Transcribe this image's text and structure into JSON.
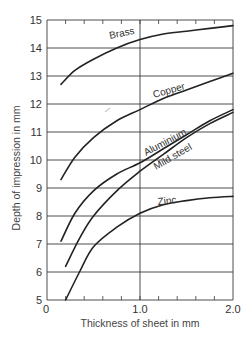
{
  "chart_data": {
    "type": "line",
    "title": "",
    "xlabel": "Thickness of sheet in mm",
    "ylabel": "Depth of impression in mm",
    "xlim": [
      0,
      2.0
    ],
    "ylim": [
      5,
      15
    ],
    "x_tick_labels": [
      "0",
      "1.0",
      "2.0"
    ],
    "x_minor_ticks_step": 0.2,
    "y_tick_labels": [
      "5",
      "6",
      "7",
      "8",
      "9",
      "10",
      "11",
      "12",
      "13",
      "14",
      "15"
    ],
    "grid": {
      "horizontal": true,
      "vertical_at": [
        1.0
      ]
    },
    "legend": "inline curve labels",
    "series": [
      {
        "name": "Brass",
        "x": [
          0.15,
          0.3,
          0.5,
          0.75,
          1.0,
          1.25,
          1.5,
          1.75,
          2.0
        ],
        "y": [
          12.7,
          13.2,
          13.6,
          14.0,
          14.3,
          14.5,
          14.6,
          14.7,
          14.8
        ]
      },
      {
        "name": "Copper",
        "x": [
          0.15,
          0.3,
          0.5,
          0.75,
          1.0,
          1.25,
          1.5,
          1.75,
          2.0
        ],
        "y": [
          9.3,
          10.1,
          10.8,
          11.4,
          11.8,
          12.2,
          12.5,
          12.8,
          13.1
        ]
      },
      {
        "name": "Aluminium",
        "x": [
          0.15,
          0.3,
          0.5,
          0.75,
          1.0,
          1.25,
          1.5,
          1.75,
          2.0
        ],
        "y": [
          7.1,
          8.1,
          8.9,
          9.5,
          9.9,
          10.4,
          10.9,
          11.4,
          11.8
        ]
      },
      {
        "name": "Mild steel",
        "x": [
          0.2,
          0.35,
          0.5,
          0.75,
          1.0,
          1.25,
          1.5,
          1.75,
          2.0
        ],
        "y": [
          6.2,
          7.2,
          8.0,
          8.9,
          9.6,
          10.2,
          10.8,
          11.3,
          11.7
        ]
      },
      {
        "name": "Zinc",
        "x": [
          0.2,
          0.35,
          0.5,
          0.75,
          1.0,
          1.25,
          1.5,
          1.75,
          2.0
        ],
        "y": [
          5.0,
          6.0,
          6.9,
          7.6,
          8.1,
          8.4,
          8.55,
          8.65,
          8.7
        ]
      }
    ]
  },
  "labels": {
    "xlabel": "Thickness of sheet in mm",
    "ylabel": "Depth of impression in mm",
    "brass": "Brass",
    "copper": "Copper",
    "aluminium": "Aluminium",
    "mild_steel": "Mild steel",
    "zinc": "Zinc"
  }
}
